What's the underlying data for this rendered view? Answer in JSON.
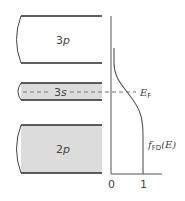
{
  "diagram": {
    "colors": {
      "band_line": "#2a2a2a",
      "filled_band": "#dcdcdc",
      "axis": "#555555",
      "curve": "#555555",
      "dashed": "#777777",
      "text": "#444444"
    },
    "bands": [
      {
        "label": "3p",
        "label_num": "3",
        "label_letter": "p",
        "filled": false
      },
      {
        "label": "3s",
        "label_num": "3",
        "label_letter": "s",
        "filled": true,
        "partially_filled": true
      },
      {
        "label": "2p",
        "label_num": "2",
        "label_letter": "p",
        "filled": true
      }
    ],
    "fermi_level": {
      "label_main": "E",
      "label_sub": "F",
      "label": "E_F"
    },
    "function_label": {
      "main": "f",
      "sub": "FD",
      "arg": "(E)",
      "label": "f_FD(E)"
    },
    "axis_ticks": [
      "0",
      "1"
    ]
  }
}
